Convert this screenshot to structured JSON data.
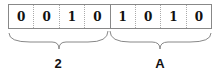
{
  "bits": [
    "0",
    "0",
    "1",
    "0",
    "1",
    "0",
    "1",
    "0"
  ],
  "groups": [
    {
      "label": "2",
      "bits": "0010"
    },
    {
      "label": "A",
      "bits": "1010"
    }
  ],
  "colors": {
    "border": "#888888",
    "text": "#111111",
    "brace": "#888888"
  }
}
